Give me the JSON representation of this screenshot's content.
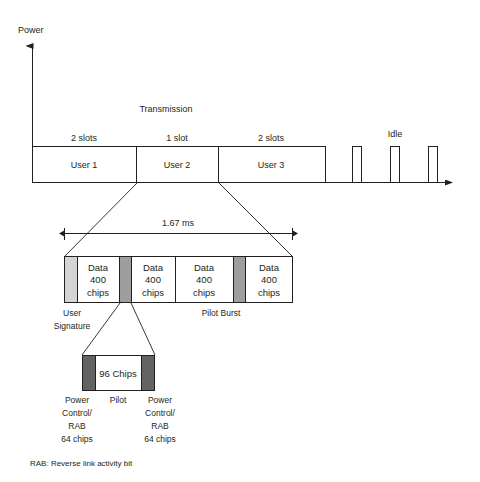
{
  "figure": {
    "footnote": "RAB: Reverse link activity bit",
    "colors": {
      "line": "#231f20",
      "user_signature_fill": "#d4d4d4",
      "pilot_burst_fill": "#9e9e9e",
      "power_control_fill": "#636363",
      "background": "#ffffff"
    }
  },
  "axes": {
    "y_label": "Power",
    "x_label": ""
  },
  "timeline": {
    "transmission_label": "Transmission",
    "idle_label": "Idle",
    "slots": [
      {
        "duration_label": "2 slots",
        "user_label": "User 1"
      },
      {
        "duration_label": "1 slot",
        "user_label": "User 2"
      },
      {
        "duration_label": "2 slots",
        "user_label": "User 3"
      }
    ],
    "idle_pulse_count": 3
  },
  "frame": {
    "duration_label": "1.67 ms",
    "user_signature_label": "User\nSignature",
    "user_signature_label_line1": "User",
    "user_signature_label_line2": "Signature",
    "pilot_burst_label": "Pilot Burst",
    "segments": [
      {
        "type": "user-signature",
        "label": ""
      },
      {
        "type": "data",
        "line1": "Data",
        "line2": "400",
        "line3": "chips"
      },
      {
        "type": "pilot-burst",
        "label": ""
      },
      {
        "type": "data",
        "line1": "Data",
        "line2": "400",
        "line3": "chips"
      },
      {
        "type": "data",
        "line1": "Data",
        "line2": "400",
        "line3": "chips"
      },
      {
        "type": "pilot-burst",
        "label": ""
      },
      {
        "type": "data",
        "line1": "Data",
        "line2": "400",
        "line3": "chips"
      }
    ]
  },
  "pilot_detail": {
    "center_label": "96 Chips",
    "center_caption": "Pilot",
    "left": {
      "line1": "Power",
      "line2": "Control/",
      "line3": "RAB",
      "line4": "64 chips"
    },
    "right": {
      "line1": "Power",
      "line2": "Control/",
      "line3": "RAB",
      "line4": "64 chips"
    }
  }
}
